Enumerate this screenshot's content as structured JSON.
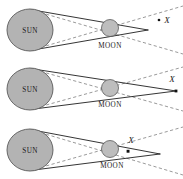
{
  "figure": {
    "width": 183,
    "height": 179,
    "background": "#ffffff",
    "panel_count": 3
  },
  "labels": {
    "sun": "SUN",
    "moon": "MOON",
    "point_x": "X"
  },
  "colors": {
    "sun_fill": "#b3b3b3",
    "sun_stroke": "#5a5a5a",
    "moon_fill": "#bdbdbd",
    "moon_stroke": "#5a5a5a",
    "umbra_line": "#111111",
    "penumbra_line": "#6e6e6e",
    "text": "#1a1a1a"
  },
  "panels": [
    {
      "id": "panel-annular",
      "index": 1,
      "sun": {
        "cx": 30,
        "cy": 30,
        "rx": 23,
        "ry": 21,
        "label": "SUN"
      },
      "moon": {
        "cx": 110,
        "cy": 28,
        "r": 8.5,
        "label": "MOON",
        "label_x": 110,
        "label_y": 48
      },
      "umbra_apex": {
        "x": 148,
        "y": 30
      },
      "point_x": {
        "dot_x": 159,
        "dot_y": 20,
        "label_x": 167,
        "label_y": 22,
        "label": "X",
        "inside_umbra": false
      },
      "umbra_lines": [
        {
          "x1": 30,
          "y1": 9.5,
          "x2": 148,
          "y2": 30
        },
        {
          "x1": 30,
          "y1": 50.5,
          "x2": 148,
          "y2": 30
        }
      ],
      "penumbra_lines": [
        {
          "x1": 30,
          "y1": 9.5,
          "x2": 183,
          "y2": 54
        },
        {
          "x1": 30,
          "y1": 50.5,
          "x2": 183,
          "y2": 6
        }
      ],
      "note": "Umbra cone tip falls short of X; X lies outside the umbra"
    },
    {
      "id": "panel-exact",
      "index": 2,
      "sun": {
        "cx": 30,
        "cy": 30,
        "rx": 23,
        "ry": 21,
        "label": "SUN"
      },
      "moon": {
        "cx": 110,
        "cy": 29,
        "r": 8.5,
        "label": "MOON",
        "label_x": 110,
        "label_y": 48
      },
      "umbra_apex": {
        "x": 176,
        "y": 32
      },
      "point_x": {
        "dot_x": 176,
        "dot_y": 32,
        "label_x": 172,
        "label_y": 20,
        "label": "X",
        "inside_umbra": true
      },
      "umbra_lines": [
        {
          "x1": 30,
          "y1": 9.5,
          "x2": 176,
          "y2": 32
        },
        {
          "x1": 30,
          "y1": 50.5,
          "x2": 176,
          "y2": 32
        }
      ],
      "penumbra_lines": [
        {
          "x1": 30,
          "y1": 9.5,
          "x2": 183,
          "y2": 52
        },
        {
          "x1": 30,
          "y1": 50.5,
          "x2": 183,
          "y2": 8
        }
      ],
      "note": "Umbra cone tip reaches exactly the point X"
    },
    {
      "id": "panel-total",
      "index": 3,
      "sun": {
        "cx": 30,
        "cy": 31,
        "rx": 23,
        "ry": 21,
        "label": "SUN"
      },
      "moon": {
        "cx": 110,
        "cy": 30,
        "r": 8.5,
        "label": "MOON",
        "label_x": 112,
        "label_y": 49
      },
      "umbra_apex": {
        "x": 128,
        "y": 32
      },
      "point_x": {
        "dot_x": 128,
        "dot_y": 32,
        "label_x": 131,
        "label_y": 22,
        "label": "X",
        "inside_umbra": true
      },
      "umbra_lines": [
        {
          "x1": 30,
          "y1": 10.5,
          "x2": 160,
          "y2": 35
        },
        {
          "x1": 30,
          "y1": 51.5,
          "x2": 160,
          "y2": 35
        }
      ],
      "penumbra_lines": [
        {
          "x1": 30,
          "y1": 10.5,
          "x2": 183,
          "y2": 56
        },
        {
          "x1": 30,
          "y1": 51.5,
          "x2": 183,
          "y2": 8
        }
      ],
      "note": "Umbra cone extends beyond X; X lies inside the umbra"
    }
  ]
}
